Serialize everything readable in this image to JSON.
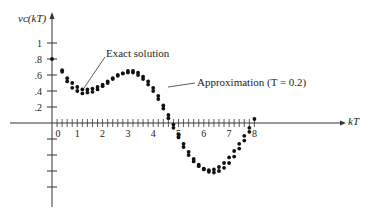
{
  "chart_data": {
    "type": "scatter",
    "title": "",
    "xlabel": "kT",
    "ylabel": "v_c(kT)",
    "x_ticks": [
      "0",
      "1",
      "2",
      "3",
      "4",
      "5",
      "6",
      "7",
      "8"
    ],
    "y_ticks": [
      "1",
      ".8",
      ".6",
      ".4",
      ".2"
    ],
    "xlim": [
      0,
      8
    ],
    "ylim": [
      -0.8,
      1
    ],
    "grid": false,
    "annotations": [
      "Exact solution",
      "Approximation (T = 0.2)"
    ],
    "series": [
      {
        "name": "Exact solution",
        "x": [
          0.0,
          0.4,
          0.6,
          0.8,
          1.0,
          1.2,
          1.4,
          1.6,
          1.8,
          2.0,
          2.2,
          2.4,
          2.6,
          2.8,
          3.0,
          3.2,
          3.4,
          3.6,
          3.8,
          4.0,
          4.2,
          4.4,
          4.6,
          4.8,
          5.0,
          5.2,
          5.4,
          5.6,
          5.8,
          6.0,
          6.2,
          6.4,
          6.6,
          6.8,
          7.0,
          7.2,
          7.4,
          7.6,
          7.8,
          8.0
        ],
        "values": [
          0.8,
          0.66,
          0.56,
          0.5,
          0.45,
          0.42,
          0.42,
          0.43,
          0.45,
          0.48,
          0.52,
          0.56,
          0.6,
          0.62,
          0.63,
          0.63,
          0.6,
          0.55,
          0.48,
          0.4,
          0.3,
          0.18,
          0.06,
          -0.06,
          -0.18,
          -0.3,
          -0.4,
          -0.48,
          -0.54,
          -0.58,
          -0.59,
          -0.58,
          -0.55,
          -0.5,
          -0.43,
          -0.35,
          -0.26,
          -0.16,
          -0.06,
          0.05
        ]
      },
      {
        "name": "Approximation (T = 0.2)",
        "x": [
          0.4,
          0.6,
          0.8,
          1.0,
          1.2,
          1.4,
          1.6,
          1.8,
          2.0,
          2.2,
          2.4,
          2.6,
          2.8,
          3.0,
          3.2,
          3.4,
          3.6,
          3.8,
          4.0,
          4.2,
          4.4,
          4.6,
          4.8,
          5.0,
          5.2,
          5.4,
          5.6,
          5.8,
          6.0,
          6.2,
          6.4,
          6.6,
          6.8,
          7.0,
          7.2,
          7.4,
          7.6,
          7.8
        ],
        "values": [
          0.64,
          0.52,
          0.44,
          0.4,
          0.37,
          0.38,
          0.39,
          0.42,
          0.46,
          0.5,
          0.55,
          0.59,
          0.62,
          0.65,
          0.65,
          0.63,
          0.58,
          0.52,
          0.44,
          0.34,
          0.22,
          0.1,
          -0.02,
          -0.14,
          -0.26,
          -0.36,
          -0.45,
          -0.52,
          -0.57,
          -0.61,
          -0.62,
          -0.6,
          -0.56,
          -0.5,
          -0.42,
          -0.32,
          -0.22,
          -0.11
        ]
      }
    ]
  }
}
